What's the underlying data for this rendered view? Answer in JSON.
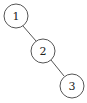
{
  "diagram": {
    "type": "tree",
    "colors": {
      "stroke": "#555555",
      "text": "#222222",
      "background": "#ffffff"
    },
    "nodes": [
      {
        "id": "n1",
        "label": "1",
        "cx": 16,
        "cy": 16,
        "r": 12
      },
      {
        "id": "n2",
        "label": "2",
        "cx": 43,
        "cy": 51,
        "r": 12
      },
      {
        "id": "n3",
        "label": "3",
        "cx": 72,
        "cy": 86,
        "r": 12
      }
    ],
    "edges": [
      {
        "from": "1",
        "to": "2"
      },
      {
        "from": "2",
        "to": "3"
      }
    ]
  }
}
